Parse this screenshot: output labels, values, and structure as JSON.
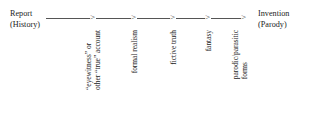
{
  "diagram": {
    "type": "continuum-axis",
    "orientation": "horizontal",
    "left_pole": {
      "line1": "Report",
      "line2": "(History)"
    },
    "right_pole": {
      "line1": "Invention",
      "line2": "(Parody)"
    },
    "arrow_marker": ">",
    "arrow_count": 5,
    "stages": [
      {
        "index": 1,
        "line1": "“eyewitness” or",
        "line2": "other “true” account"
      },
      {
        "index": 2,
        "line1": "formal realism",
        "line2": ""
      },
      {
        "index": 3,
        "line1": "fictive truth",
        "line2": ""
      },
      {
        "index": 4,
        "line1": "fantasy",
        "line2": ""
      },
      {
        "index": 5,
        "line1": "parodic/parasitic",
        "line2": "forms"
      }
    ],
    "colors": {
      "background": "#ffffff",
      "text": "#222222",
      "axis_line": "#555555"
    }
  }
}
